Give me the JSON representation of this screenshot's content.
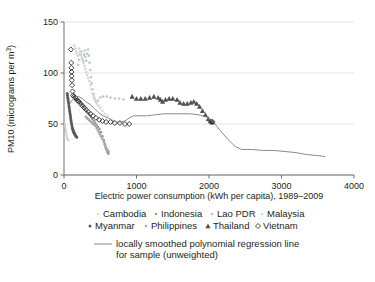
{
  "chart_data": {
    "type": "scatter",
    "title": "",
    "xlabel": "Electric power consumption (kWh per capita), 1989–2009",
    "ylabel": "PM10 (micrograms per m3)",
    "ylabel_main": "PM10 (micrograms per m",
    "ylabel_sup": "3",
    "ylabel_close": ")",
    "xlim": [
      0,
      4000
    ],
    "ylim": [
      0,
      150
    ],
    "xticks": [
      0,
      1000,
      2000,
      3000,
      4000
    ],
    "xtick_labels": [
      "0",
      "1000",
      "2000",
      "3000",
      "4000"
    ],
    "yticks": [
      0,
      50,
      100,
      150
    ],
    "ytick_labels": [
      "0",
      "50",
      "100",
      "150"
    ],
    "grid": "horizontal",
    "legend_position": "below-plot",
    "colors": {
      "cambodia": "#cfd0d2",
      "indonesia": "#98999c",
      "lao_pdr": "#c3c4c6",
      "malaysia": "#d5d6d8",
      "myanmar": "#58595b",
      "philippines": "#a7a9ac",
      "thailand": "#4f5052",
      "vietnam": "#2f3032",
      "regression": "#7d7e80",
      "axis": "#6d6e71",
      "grid": "#e3e3e4",
      "text": "#231f20",
      "background": "#ffffff"
    },
    "series": [
      {
        "name": "Cambodia",
        "marker": "dot-tiny",
        "color": "#cfd0d2",
        "points": [
          [
            14,
            50
          ],
          [
            16,
            49
          ],
          [
            18,
            48
          ],
          [
            20,
            47
          ],
          [
            22,
            46
          ],
          [
            24,
            45
          ],
          [
            26,
            44
          ],
          [
            28,
            43
          ],
          [
            30,
            42
          ],
          [
            32,
            41
          ],
          [
            34,
            40
          ],
          [
            36,
            39
          ],
          [
            38,
            38
          ],
          [
            40,
            37
          ],
          [
            42,
            36
          ],
          [
            44,
            36
          ],
          [
            46,
            35
          ],
          [
            50,
            35
          ],
          [
            55,
            34
          ],
          [
            60,
            34
          ],
          [
            66,
            34
          ]
        ]
      },
      {
        "name": "Indonesia",
        "marker": "dot-small",
        "color": "#98999c",
        "points": [
          [
            150,
            75
          ],
          [
            170,
            74
          ],
          [
            190,
            73
          ],
          [
            210,
            72
          ],
          [
            230,
            71
          ],
          [
            250,
            69
          ],
          [
            270,
            67
          ],
          [
            290,
            65
          ],
          [
            310,
            63
          ],
          [
            330,
            61
          ],
          [
            350,
            59
          ],
          [
            370,
            57
          ],
          [
            390,
            55
          ],
          [
            410,
            53
          ],
          [
            430,
            51
          ],
          [
            450,
            49
          ],
          [
            470,
            47
          ],
          [
            490,
            45
          ],
          [
            510,
            42
          ],
          [
            530,
            38
          ],
          [
            550,
            34
          ],
          [
            565,
            30
          ],
          [
            575,
            27
          ],
          [
            585,
            25
          ],
          [
            595,
            23
          ],
          [
            605,
            22
          ],
          [
            612,
            21
          ]
        ]
      },
      {
        "name": "Lao PDR",
        "marker": "dot-small",
        "color": "#c3c4c6",
        "points": [
          [
            195,
            108
          ],
          [
            210,
            113
          ],
          [
            225,
            118
          ],
          [
            238,
            121
          ],
          [
            250,
            115
          ],
          [
            262,
            112
          ],
          [
            275,
            118
          ],
          [
            285,
            122
          ],
          [
            295,
            116
          ],
          [
            305,
            112
          ],
          [
            318,
            119
          ],
          [
            330,
            123
          ],
          [
            342,
            117
          ],
          [
            352,
            110
          ],
          [
            362,
            103
          ],
          [
            372,
            96
          ],
          [
            382,
            90
          ],
          [
            395,
            84
          ],
          [
            408,
            79
          ],
          [
            420,
            75
          ],
          [
            440,
            72
          ],
          [
            470,
            73
          ],
          [
            500,
            76
          ],
          [
            540,
            77
          ],
          [
            590,
            77
          ],
          [
            640,
            76
          ],
          [
            700,
            75
          ],
          [
            760,
            75
          ],
          [
            820,
            74
          ]
        ]
      },
      {
        "name": "Malaysia",
        "marker": "dot-small",
        "color": "#d5d6d8",
        "points": [
          [
            140,
            127
          ],
          [
            155,
            124
          ],
          [
            168,
            121
          ],
          [
            180,
            119
          ],
          [
            195,
            117
          ],
          [
            208,
            124
          ],
          [
            220,
            121
          ],
          [
            232,
            118
          ],
          [
            245,
            116
          ],
          [
            258,
            113
          ],
          [
            270,
            110
          ],
          [
            282,
            107
          ],
          [
            295,
            104
          ],
          [
            308,
            101
          ],
          [
            320,
            98
          ],
          [
            335,
            95
          ],
          [
            350,
            92
          ],
          [
            365,
            88
          ],
          [
            380,
            84
          ],
          [
            395,
            80
          ],
          [
            412,
            77
          ],
          [
            430,
            73
          ],
          [
            450,
            70
          ],
          [
            475,
            68
          ],
          [
            500,
            66
          ],
          [
            530,
            63
          ],
          [
            560,
            60
          ],
          [
            600,
            58
          ]
        ]
      },
      {
        "name": "Myanmar",
        "marker": "dot-med",
        "color": "#58595b",
        "points": [
          [
            45,
            80
          ],
          [
            48,
            78
          ],
          [
            52,
            76
          ],
          [
            56,
            74
          ],
          [
            60,
            72
          ],
          [
            64,
            70
          ],
          [
            68,
            68
          ],
          [
            72,
            66
          ],
          [
            76,
            64
          ],
          [
            80,
            62
          ],
          [
            84,
            60
          ],
          [
            88,
            58
          ],
          [
            92,
            56
          ],
          [
            96,
            54
          ],
          [
            100,
            52
          ],
          [
            105,
            50
          ],
          [
            110,
            48
          ],
          [
            115,
            46
          ],
          [
            120,
            45
          ],
          [
            125,
            44
          ],
          [
            130,
            43
          ],
          [
            136,
            42
          ],
          [
            142,
            41
          ],
          [
            150,
            40
          ],
          [
            158,
            39
          ],
          [
            166,
            38
          ],
          [
            175,
            37
          ]
        ]
      },
      {
        "name": "Philippines",
        "marker": "dot-small",
        "color": "#a7a9ac",
        "points": [
          [
            300,
            57
          ],
          [
            315,
            56
          ],
          [
            330,
            55
          ],
          [
            345,
            54
          ],
          [
            360,
            53
          ],
          [
            375,
            52
          ],
          [
            390,
            51
          ],
          [
            405,
            50
          ],
          [
            420,
            49
          ],
          [
            435,
            48
          ],
          [
            450,
            46
          ],
          [
            465,
            44
          ],
          [
            480,
            42
          ],
          [
            495,
            40
          ],
          [
            510,
            38
          ],
          [
            525,
            36
          ],
          [
            540,
            34
          ],
          [
            552,
            32
          ],
          [
            564,
            30
          ],
          [
            575,
            28
          ],
          [
            585,
            26
          ],
          [
            595,
            25
          ],
          [
            605,
            24
          ],
          [
            615,
            23
          ]
        ]
      },
      {
        "name": "Thailand",
        "marker": "triangle",
        "color": "#4f5052",
        "points": [
          [
            940,
            77
          ],
          [
            1000,
            75
          ],
          [
            1060,
            75
          ],
          [
            1120,
            75
          ],
          [
            1180,
            76
          ],
          [
            1240,
            77
          ],
          [
            1300,
            76
          ],
          [
            1330,
            74
          ],
          [
            1360,
            72
          ],
          [
            1400,
            74
          ],
          [
            1450,
            75
          ],
          [
            1500,
            75
          ],
          [
            1560,
            74
          ],
          [
            1600,
            71
          ],
          [
            1650,
            70
          ],
          [
            1700,
            70
          ],
          [
            1750,
            71
          ],
          [
            1790,
            72
          ],
          [
            1830,
            70
          ],
          [
            1870,
            67
          ],
          [
            1910,
            63
          ],
          [
            1950,
            59
          ],
          [
            1990,
            55
          ],
          [
            2020,
            53
          ],
          [
            2045,
            52
          ]
        ]
      },
      {
        "name": "Vietnam",
        "marker": "diamond-open",
        "color": "#2f3032",
        "points": [
          [
            95,
            123
          ],
          [
            100,
            110
          ],
          [
            102,
            105
          ],
          [
            104,
            101
          ],
          [
            106,
            97
          ],
          [
            108,
            93
          ],
          [
            112,
            88
          ],
          [
            118,
            82
          ],
          [
            126,
            78
          ],
          [
            138,
            77
          ],
          [
            150,
            76
          ],
          [
            165,
            75
          ],
          [
            185,
            73
          ],
          [
            205,
            72
          ],
          [
            228,
            70
          ],
          [
            252,
            68
          ],
          [
            278,
            66
          ],
          [
            305,
            64
          ],
          [
            335,
            62
          ],
          [
            365,
            60
          ],
          [
            400,
            58
          ],
          [
            440,
            56
          ],
          [
            485,
            54
          ],
          [
            530,
            53
          ],
          [
            580,
            52
          ],
          [
            640,
            52
          ],
          [
            700,
            51
          ],
          [
            770,
            51
          ],
          [
            840,
            50
          ],
          [
            900,
            50
          ],
          [
            2030,
            52
          ],
          [
            2050,
            52
          ]
        ]
      }
    ],
    "regression_line": {
      "name": "locally smoothed polynomial regression line for sample (unweighted)",
      "color": "#7d7e80",
      "points": [
        [
          80,
          70
        ],
        [
          120,
          74
        ],
        [
          160,
          77
        ],
        [
          200,
          77
        ],
        [
          250,
          75
        ],
        [
          300,
          72
        ],
        [
          360,
          69
        ],
        [
          420,
          65
        ],
        [
          480,
          61
        ],
        [
          540,
          58
        ],
        [
          600,
          56
        ],
        [
          660,
          54
        ],
        [
          720,
          52
        ],
        [
          780,
          52
        ],
        [
          840,
          53
        ],
        [
          900,
          56
        ],
        [
          960,
          58
        ],
        [
          1040,
          58
        ],
        [
          1140,
          58
        ],
        [
          1260,
          59
        ],
        [
          1380,
          60
        ],
        [
          1500,
          60
        ],
        [
          1620,
          60
        ],
        [
          1740,
          60
        ],
        [
          1860,
          59
        ],
        [
          1960,
          57
        ],
        [
          2060,
          52
        ],
        [
          2150,
          44
        ],
        [
          2260,
          35
        ],
        [
          2360,
          28
        ],
        [
          2450,
          25
        ],
        [
          2600,
          25
        ],
        [
          2750,
          24
        ],
        [
          2900,
          24
        ],
        [
          3050,
          23
        ],
        [
          3200,
          22
        ],
        [
          3350,
          20
        ],
        [
          3500,
          19
        ],
        [
          3600,
          18
        ]
      ]
    },
    "legend": {
      "row1": [
        {
          "label": "Cambodia",
          "marker": "dot-tiny",
          "color": "#cfd0d2"
        },
        {
          "label": "Indonesia",
          "marker": "dot-small",
          "color": "#98999c"
        },
        {
          "label": "Lao PDR",
          "marker": "dot-small",
          "color": "#c3c4c6"
        },
        {
          "label": "Malaysia",
          "marker": "dot-small",
          "color": "#d5d6d8"
        }
      ],
      "row2": [
        {
          "label": "Myanmar",
          "marker": "dot-med",
          "color": "#58595b"
        },
        {
          "label": "Philippines",
          "marker": "dot-small",
          "color": "#a7a9ac"
        },
        {
          "label": "Thailand",
          "marker": "triangle",
          "color": "#4f5052"
        },
        {
          "label": "Vietnam",
          "marker": "diamond-open",
          "color": "#2f3032"
        }
      ],
      "regression_line_label_1": "locally smoothed polynomial regression line",
      "regression_line_label_2": "for sample (unweighted)"
    }
  }
}
